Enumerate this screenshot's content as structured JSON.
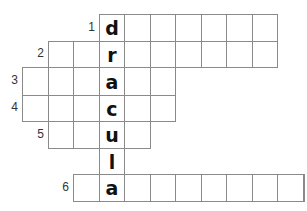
{
  "puzzle": {
    "type": "crossword",
    "solution_word": "dracula",
    "grid": {
      "col_x": [
        22,
        48,
        73,
        99,
        124,
        150,
        175,
        201,
        226,
        252,
        277,
        303
      ],
      "row_y": [
        14,
        41,
        67,
        95,
        121,
        148,
        174,
        201
      ],
      "line_color": "#8a8a8a",
      "key_column": 3
    },
    "rows": [
      {
        "clue_number": "1",
        "start_col": 3,
        "end_col": 9,
        "letters": {
          "3": "d"
        }
      },
      {
        "clue_number": "2",
        "start_col": 1,
        "end_col": 9,
        "letters": {
          "3": "r"
        }
      },
      {
        "clue_number": "3",
        "start_col": 0,
        "end_col": 5,
        "letters": {
          "3": "a"
        }
      },
      {
        "clue_number": "4",
        "start_col": 0,
        "end_col": 5,
        "letters": {
          "3": "c"
        }
      },
      {
        "clue_number": "5",
        "start_col": 1,
        "end_col": 4,
        "letters": {
          "3": "u"
        }
      },
      {
        "clue_number": "",
        "start_col": 3,
        "end_col": 3,
        "letters": {
          "3": "l"
        }
      },
      {
        "clue_number": "6",
        "start_col": 2,
        "end_col": 11,
        "letters": {
          "3": "a"
        }
      }
    ]
  }
}
